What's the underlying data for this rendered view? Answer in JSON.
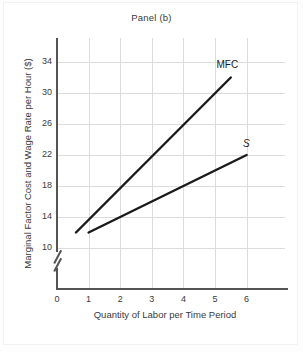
{
  "chart_data": {
    "type": "line",
    "title": "Panel (b)",
    "xlabel": "Quantity of Labor per Time Period",
    "ylabel": "Marginal Factor Cost and Wage Rate per Hour ($)",
    "xlim": [
      0,
      6.8
    ],
    "ylim": [
      10,
      35.1
    ],
    "xticks": [
      0,
      1,
      2,
      3,
      4,
      5,
      6
    ],
    "yticks": [
      10,
      14,
      18,
      22,
      26,
      30,
      34
    ],
    "xtick_labels": [
      "0",
      "1",
      "2",
      "3",
      "4",
      "5",
      "6"
    ],
    "ytick_labels": [
      "10",
      "14",
      "18",
      "22",
      "26",
      "30",
      "34"
    ],
    "grid": true,
    "y_axis_break": true,
    "legend_position": "inline-end-of-line",
    "series": [
      {
        "name": "MFC",
        "label": "MFC",
        "italic": false,
        "color": "#1a1a1a",
        "x": [
          0.6,
          5.5
        ],
        "y": [
          12,
          32
        ],
        "label_x": 5.3,
        "label_y": 33.6
      },
      {
        "name": "S",
        "label": "S",
        "italic": true,
        "color": "#1a1a1a",
        "x": [
          1.0,
          6.0
        ],
        "y": [
          12,
          22
        ],
        "label_x": 5.95,
        "label_y": 23.4
      }
    ],
    "colors": {
      "line": "#1a1a1a",
      "grid": "#dcdcdc",
      "axis": "#555555",
      "text": "#3a3a3a",
      "background": "#ffffff"
    }
  }
}
